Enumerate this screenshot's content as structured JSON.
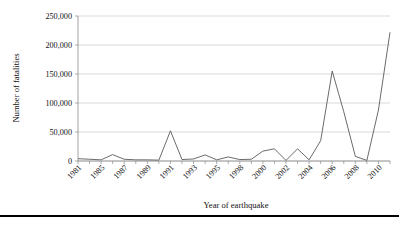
{
  "chart_data": {
    "type": "line",
    "title": "",
    "xlabel": "Year of earthquake",
    "ylabel": "Number of fatalities",
    "ylim": [
      0,
      250000
    ],
    "grid": true,
    "legend": false,
    "ytick_labels": [
      "250,000",
      "200,000",
      "150,000",
      "100,000",
      "50,000",
      "0"
    ],
    "ytick_values": [
      250000,
      200000,
      150000,
      100000,
      50000,
      0
    ],
    "xtick_labels": [
      "1981",
      "1985",
      "1987",
      "1989",
      "1991",
      "1993",
      "1995",
      "1998",
      "2000",
      "2002",
      "2004",
      "2006",
      "2008",
      "2010"
    ],
    "x": [
      1981,
      1983,
      1985,
      1986,
      1987,
      1988,
      1989,
      1990,
      1991,
      1992,
      1993,
      1994,
      1995,
      1997,
      1998,
      1999,
      2000,
      2001,
      2002,
      2003,
      2004,
      2005,
      2006,
      2007,
      2008,
      2009,
      2010,
      2011
    ],
    "categories": [
      "1981",
      "1983",
      "1985",
      "1986",
      "1987",
      "1988",
      "1989",
      "1990",
      "1991",
      "1992",
      "1993",
      "1994",
      "1995",
      "1997",
      "1998",
      "1999",
      "2000",
      "2001",
      "2002",
      "2003",
      "2004",
      "2005",
      "2006",
      "2007",
      "2008",
      "2009",
      "2010",
      "2011"
    ],
    "values": [
      4000,
      3000,
      2000,
      11000,
      3000,
      2000,
      2000,
      1500,
      52000,
      2500,
      3500,
      10500,
      2000,
      7000,
      2500,
      3000,
      17000,
      21000,
      1000,
      21000,
      2000,
      35000,
      155000,
      85000,
      8000,
      1000,
      88000,
      222000
    ],
    "series": [
      {
        "name": "Number of fatalities",
        "values": [
          4000,
          3000,
          2000,
          11000,
          3000,
          2000,
          2000,
          1500,
          52000,
          2500,
          3500,
          10500,
          2000,
          7000,
          2500,
          3000,
          17000,
          21000,
          1000,
          21000,
          2000,
          35000,
          155000,
          85000,
          8000,
          1000,
          88000,
          222000
        ]
      }
    ],
    "colors": {
      "line": "#5a5a5a",
      "grid": "#c8c8c8",
      "axis": "#8a8a8a",
      "text": "#111111",
      "background": "#ffffff"
    }
  }
}
